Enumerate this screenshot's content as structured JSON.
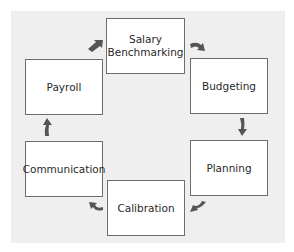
{
  "diagram": {
    "type": "cycle",
    "direction": "clockwise",
    "nodes": [
      {
        "id": "salary",
        "label_line1": "Salary",
        "label_line2": "Benchmarking"
      },
      {
        "id": "budgeting",
        "label": "Budgeting"
      },
      {
        "id": "planning",
        "label": "Planning"
      },
      {
        "id": "calibration",
        "label": "Calibration"
      },
      {
        "id": "communication",
        "label": "Communication"
      },
      {
        "id": "payroll",
        "label": "Payroll"
      }
    ],
    "edges": [
      {
        "from": "salary",
        "to": "budgeting"
      },
      {
        "from": "budgeting",
        "to": "planning"
      },
      {
        "from": "planning",
        "to": "calibration"
      },
      {
        "from": "calibration",
        "to": "communication"
      },
      {
        "from": "communication",
        "to": "payroll"
      },
      {
        "from": "payroll",
        "to": "salary"
      }
    ],
    "colors": {
      "panel": "#efefef",
      "box_border": "#6d6d6d",
      "arrow": "#555555",
      "text": "#2a2a2a"
    }
  }
}
